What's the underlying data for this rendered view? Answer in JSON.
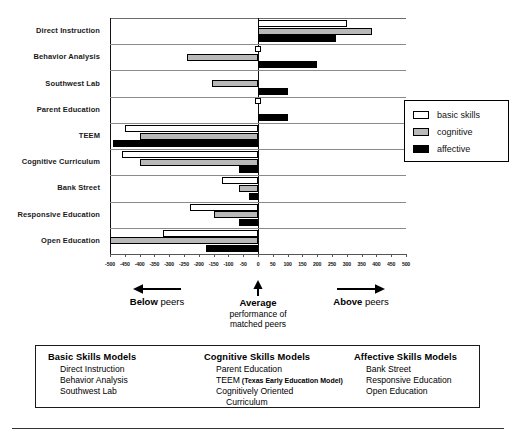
{
  "chart_data": {
    "type": "bar",
    "orientation": "horizontal",
    "title": "",
    "xlabel": "",
    "ylabel": "",
    "xlim": [
      -500,
      500
    ],
    "grid": true,
    "legend_position": "right",
    "ticks": [
      -500,
      -450,
      -400,
      -350,
      -300,
      -250,
      -200,
      -150,
      -100,
      -50,
      0,
      50,
      100,
      150,
      200,
      250,
      300,
      350,
      400,
      450,
      500
    ],
    "categories": [
      "Direct Instruction",
      "Behavior Analysis",
      "Southwest Lab",
      "Parent Education",
      "TEEM",
      "Cognitive Curriculum",
      "Bank Street",
      "Responsive Education",
      "Open Education"
    ],
    "series": [
      {
        "name": "basic skills",
        "color": "#ffffff",
        "values": [
          300,
          0,
          null,
          0,
          -450,
          -460,
          -120,
          -230,
          -320
        ]
      },
      {
        "name": "cognitive",
        "color": "#b9b9b9",
        "values": [
          385,
          -240,
          -155,
          null,
          -400,
          -400,
          -65,
          -150,
          -500
        ]
      },
      {
        "name": "affective",
        "color": "#000000",
        "values": [
          265,
          200,
          100,
          100,
          -490,
          -65,
          -30,
          -65,
          -175
        ]
      }
    ]
  },
  "legend": {
    "items": [
      {
        "label": "basic skills",
        "swatch": "basic"
      },
      {
        "label": "cognitive",
        "swatch": "cognitive"
      },
      {
        "label": "affective",
        "swatch": "affective"
      }
    ]
  },
  "annotations": {
    "below": {
      "strong": "Below",
      "rest": " peers",
      "arrow": "left-arrow-icon"
    },
    "average": {
      "strong": "Average",
      "line2": "performance of",
      "line3": "matched peers",
      "arrow": "up-arrow-icon"
    },
    "above": {
      "strong": "Above",
      "rest": " peers",
      "arrow": "right-arrow-icon"
    }
  },
  "models_box": {
    "columns": [
      {
        "title": "Basic Skills Models",
        "items": [
          {
            "text": "Direct Instruction"
          },
          {
            "text": "Behavior Analysis"
          },
          {
            "text": "Southwest Lab"
          }
        ]
      },
      {
        "title": "Cognitive Skills Models",
        "items": [
          {
            "text": "Parent Education"
          },
          {
            "text": "TEEM",
            "paren": "(Texas Early Education Model)"
          },
          {
            "text": "Cognitively Oriented"
          },
          {
            "text": "Curriculum",
            "indent": true
          }
        ]
      },
      {
        "title": "Affective Skills Models",
        "items": [
          {
            "text": "Bank Street"
          },
          {
            "text": "Responsive Education"
          },
          {
            "text": "Open Education"
          }
        ]
      }
    ]
  }
}
